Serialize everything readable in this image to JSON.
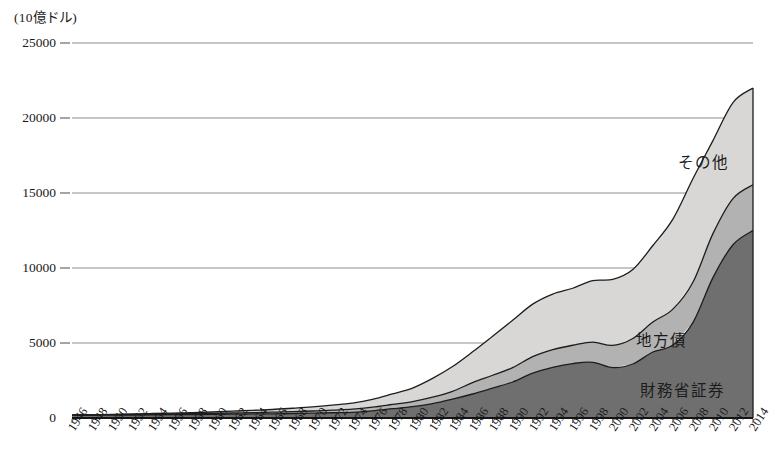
{
  "chart_data": {
    "type": "area",
    "stacked": true,
    "title": "",
    "subtitle": "",
    "unit_label": "(10億ドル)",
    "xlabel": "",
    "ylabel": "",
    "ylim": [
      0,
      25000
    ],
    "yticks": [
      0,
      5000,
      10000,
      15000,
      20000,
      25000
    ],
    "ytick_labels": [
      "0",
      "5000",
      "10000",
      "15000",
      "20000",
      "25000"
    ],
    "grid": true,
    "legend_position": "inline-annotations",
    "x": [
      1946,
      1948,
      1950,
      1952,
      1954,
      1956,
      1958,
      1960,
      1962,
      1964,
      1966,
      1968,
      1970,
      1972,
      1974,
      1976,
      1978,
      1980,
      1982,
      1984,
      1986,
      1988,
      1990,
      1992,
      1994,
      1996,
      1998,
      2000,
      2002,
      2004,
      2006,
      2008,
      2010,
      2012,
      2014
    ],
    "xtick_labels": [
      "1946",
      "1948",
      "1950",
      "1952",
      "1954",
      "1956",
      "1958",
      "1960",
      "1962",
      "1964",
      "1966",
      "1968",
      "1970",
      "1972",
      "1974",
      "1976",
      "1978",
      "1980",
      "1982",
      "1984",
      "1986",
      "1988",
      "1990",
      "1992",
      "1994",
      "1996",
      "1998",
      "2000",
      "2002",
      "2004",
      "2006",
      "2008",
      "2010",
      "2012",
      "2014"
    ],
    "series": [
      {
        "name": "財務省証券",
        "color": "#706f6f",
        "values": [
          180,
          185,
          190,
          200,
          215,
          220,
          230,
          240,
          255,
          270,
          280,
          300,
          320,
          350,
          380,
          480,
          620,
          760,
          960,
          1260,
          1600,
          1990,
          2400,
          2990,
          3380,
          3630,
          3710,
          3360,
          3600,
          4400,
          4860,
          6360,
          9360,
          11550,
          12500
        ],
        "label_position": {
          "x": 640,
          "y": 378
        }
      },
      {
        "name": "地方債",
        "color": "#b3b2b2",
        "values": [
          15,
          18,
          22,
          28,
          35,
          45,
          55,
          66,
          78,
          92,
          106,
          124,
          145,
          176,
          208,
          240,
          285,
          335,
          430,
          520,
          760,
          860,
          960,
          1100,
          1180,
          1220,
          1350,
          1480,
          1700,
          2000,
          2400,
          2690,
          2930,
          3080,
          3050
        ],
        "label_position": {
          "x": 636,
          "y": 328
        }
      },
      {
        "name": "その他",
        "color": "#d8d7d5",
        "values": [
          15,
          20,
          28,
          38,
          50,
          62,
          78,
          95,
          120,
          150,
          180,
          225,
          275,
          330,
          400,
          520,
          700,
          900,
          1250,
          1650,
          2050,
          2600,
          3150,
          3500,
          3700,
          3800,
          4100,
          4400,
          4600,
          5100,
          6000,
          6900,
          6200,
          6400,
          6450
        ],
        "label_position": {
          "x": 678,
          "y": 150
        }
      }
    ]
  }
}
